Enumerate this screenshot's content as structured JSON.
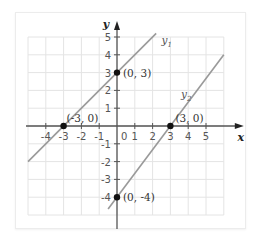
{
  "chart_data": {
    "type": "line",
    "title": "",
    "xlabel": "x",
    "ylabel": "y",
    "xlim": [
      -5,
      6
    ],
    "ylim": [
      -5,
      5
    ],
    "grid": true,
    "x_ticks": [
      -4,
      -3,
      -2,
      -1,
      1,
      2,
      3,
      4,
      5
    ],
    "y_ticks": [
      -4,
      -3,
      -2,
      -1,
      1,
      2,
      3,
      4,
      5
    ],
    "origin_label": "0",
    "series": [
      {
        "name": "y1",
        "label_main": "y",
        "label_sub": "1",
        "equation": "y = x + 3",
        "slope": 1,
        "intercept": 3,
        "x_range": [
          -5,
          2.2
        ],
        "color": "#9a9a9a"
      },
      {
        "name": "y2",
        "label_main": "y",
        "label_sub": "2",
        "equation": "y = (4/3)x - 4",
        "slope": 1.3333,
        "intercept": -4,
        "x_range": [
          -0.5,
          6.0
        ],
        "color": "#9a9a9a"
      }
    ],
    "points": [
      {
        "x": 0,
        "y": 3,
        "label": "(0, 3)"
      },
      {
        "x": -3,
        "y": 0,
        "label": "(-3, 0)"
      },
      {
        "x": 3,
        "y": 0,
        "label": "(3, 0)"
      },
      {
        "x": 0,
        "y": -4,
        "label": "(0, -4)"
      }
    ]
  },
  "colors": {
    "grid": "#e4e4e4",
    "axis": "#555555",
    "line": "#9a9a9a",
    "point": "#111111"
  }
}
